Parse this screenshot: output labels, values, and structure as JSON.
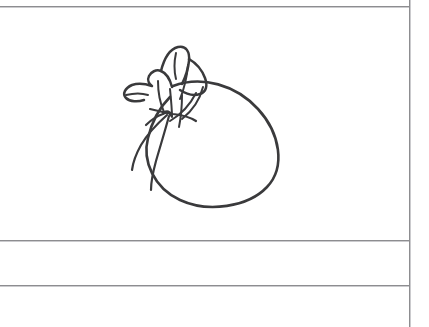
{
  "sheet": {
    "title": "Sketch Sheet",
    "background_color": "#ffffff",
    "rule_color": "#8d8d90",
    "ink_color": "#3a3a3c",
    "width": 429,
    "height": 327
  },
  "rows": [
    {
      "name": "drawing-row",
      "text": ""
    },
    {
      "name": "second-row",
      "text": ""
    },
    {
      "name": "third-row",
      "text": ""
    }
  ],
  "drawing": {
    "subject": "tied-sack",
    "description": "Hand-drawn line sketch of a cloth sack gathered and tied at the neck, with two string tails hanging down on the left",
    "caption": "",
    "icon_name": "sack-sketch"
  }
}
